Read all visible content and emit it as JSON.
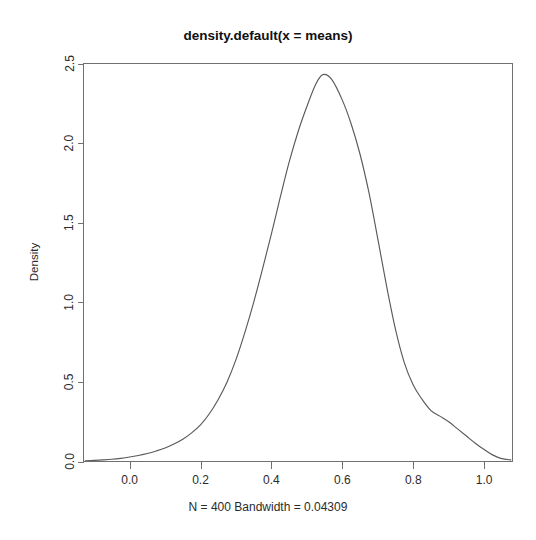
{
  "figure": {
    "title": "density.default(x = means)",
    "caption": "N = 400   Bandwidth = 0.04309",
    "ylabel": "Density",
    "xlabel": ""
  },
  "axes": {
    "x_ticks": [
      "0.0",
      "0.2",
      "0.4",
      "0.6",
      "0.8",
      "1.0"
    ],
    "y_ticks": [
      "0.0",
      "0.5",
      "1.0",
      "1.5",
      "2.0",
      "2.5"
    ]
  },
  "style": {
    "curve_color": "#5a5a5a",
    "axis_color": "#707070",
    "background": "#ffffff",
    "text_color": "#2b2b2b"
  },
  "chart_data": {
    "type": "line",
    "title": "density.default(x = means)",
    "subtitle": "N = 400   Bandwidth = 0.04309",
    "xlabel": "",
    "ylabel": "Density",
    "grid": false,
    "legend": "none",
    "xlim": [
      -0.13,
      1.08
    ],
    "ylim": [
      0.0,
      2.5
    ],
    "xticks": [
      0.0,
      0.2,
      0.4,
      0.6,
      0.8,
      1.0
    ],
    "yticks": [
      0.0,
      0.5,
      1.0,
      1.5,
      2.0,
      2.5
    ],
    "n": 400,
    "bandwidth": 0.04309,
    "peak": {
      "x": 0.545,
      "y": 2.43
    },
    "annotations": [
      {
        "text": "secondary shoulder",
        "x": 0.85,
        "y": 0.28
      }
    ],
    "series": [
      {
        "name": "density",
        "x": [
          -0.125,
          -0.1,
          -0.075,
          -0.05,
          -0.025,
          0.0,
          0.025,
          0.05,
          0.075,
          0.1,
          0.125,
          0.15,
          0.175,
          0.2,
          0.225,
          0.25,
          0.275,
          0.3,
          0.325,
          0.35,
          0.375,
          0.4,
          0.425,
          0.45,
          0.475,
          0.5,
          0.525,
          0.545,
          0.57,
          0.6,
          0.625,
          0.65,
          0.675,
          0.7,
          0.725,
          0.75,
          0.775,
          0.8,
          0.825,
          0.85,
          0.875,
          0.9,
          0.925,
          0.95,
          0.975,
          1.0,
          1.025,
          1.05,
          1.075
        ],
        "y": [
          0.005,
          0.007,
          0.01,
          0.014,
          0.02,
          0.028,
          0.038,
          0.05,
          0.066,
          0.085,
          0.11,
          0.14,
          0.18,
          0.23,
          0.3,
          0.39,
          0.5,
          0.64,
          0.81,
          1.0,
          1.21,
          1.43,
          1.66,
          1.88,
          2.07,
          2.23,
          2.37,
          2.43,
          2.4,
          2.27,
          2.12,
          1.93,
          1.69,
          1.4,
          1.1,
          0.83,
          0.62,
          0.48,
          0.39,
          0.32,
          0.285,
          0.25,
          0.205,
          0.16,
          0.115,
          0.075,
          0.04,
          0.018,
          0.01
        ]
      }
    ]
  }
}
